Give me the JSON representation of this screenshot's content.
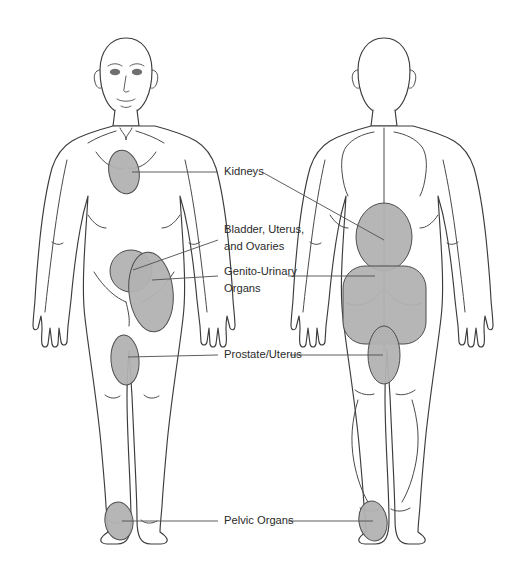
{
  "figure": {
    "canvas": {
      "width": 514,
      "height": 581
    },
    "background_color": "#ffffff",
    "region_fill_color": "#b2b2b2",
    "region_stroke_color": "#4d4d4d",
    "outline_color": "#3c3c3c",
    "label_color": "#2b2b2b",
    "leader_color": "#555555"
  },
  "views": [
    {
      "id": "anterior",
      "name": "Front View",
      "has_face": true
    },
    {
      "id": "posterior",
      "name": "Back View",
      "has_face": false
    }
  ],
  "labels": [
    {
      "id": "kidneys",
      "text": "Kidneys",
      "lines": [
        "Kidneys"
      ],
      "x": 224,
      "y": 172
    },
    {
      "id": "bladder-uterus-ovaries",
      "text": "Bladder, Uterus, and Ovaries",
      "lines": [
        "Bladder, Uterus,",
        "and Ovaries"
      ],
      "x": 224,
      "y": 230
    },
    {
      "id": "genito-urinary-organs",
      "text": "Genito-Urinary Organs",
      "lines": [
        "Genito-Urinary",
        "Organs"
      ],
      "x": 224,
      "y": 272
    },
    {
      "id": "prostate-uterus",
      "text": "Prostate/Uterus",
      "lines": [
        "Prostate/Uterus"
      ],
      "x": 224,
      "y": 355
    },
    {
      "id": "pelvic-organs",
      "text": "Pelvic Organs",
      "lines": [
        "Pelvic Organs"
      ],
      "x": 224,
      "y": 521
    }
  ],
  "pain_regions": [
    {
      "id": "front-kidneys",
      "view": "anterior",
      "label": "Kidneys",
      "body_part": "mid-torso left flank",
      "shape": "ellipse"
    },
    {
      "id": "front-bladder",
      "view": "anterior",
      "label": "Bladder, Uterus, and Ovaries",
      "body_part": "lower abdomen",
      "shape": "circle"
    },
    {
      "id": "front-genito-urinary",
      "view": "anterior",
      "label": "Genito-Urinary Organs",
      "body_part": "upper thigh",
      "shape": "ellipse"
    },
    {
      "id": "front-prostate",
      "view": "anterior",
      "label": "Prostate/Uterus",
      "body_part": "inner knee",
      "shape": "ellipse"
    },
    {
      "id": "front-pelvic",
      "view": "anterior",
      "label": "Pelvic Organs",
      "body_part": "foot",
      "shape": "ellipse"
    },
    {
      "id": "back-kidneys",
      "view": "posterior",
      "label": "Kidneys",
      "body_part": "lower back",
      "shape": "ellipse"
    },
    {
      "id": "back-genito-urinary",
      "view": "posterior",
      "label": "Genito-Urinary Organs",
      "body_part": "buttocks",
      "shape": "rounded-rect"
    },
    {
      "id": "back-prostate",
      "view": "posterior",
      "label": "Prostate/Uterus",
      "body_part": "upper posterior thigh",
      "shape": "ellipse"
    },
    {
      "id": "back-pelvic",
      "view": "posterior",
      "label": "Pelvic Organs",
      "body_part": "heel",
      "shape": "ellipse"
    }
  ]
}
